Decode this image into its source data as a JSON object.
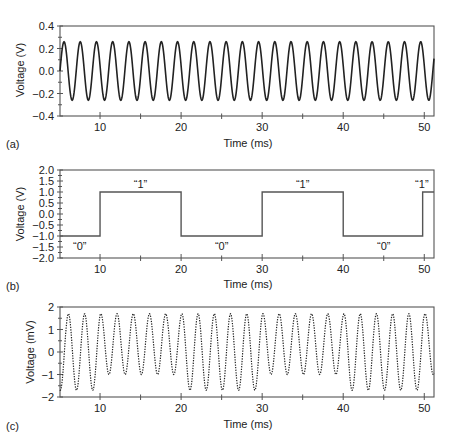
{
  "figure": {
    "panels": [
      {
        "label": "(a)",
        "ylabel": "Voltage (V)",
        "xlabel": "Time (ms)"
      },
      {
        "label": "(b)",
        "ylabel": "Voltage (V)",
        "xlabel": "Time (ms)"
      },
      {
        "label": "(c)",
        "ylabel": "Voltage (mV)",
        "xlabel": "Time (ms)"
      }
    ],
    "colors": {
      "line": "#222222",
      "axis": "#555555",
      "square": "#555555"
    }
  },
  "chart_data": [
    {
      "type": "line",
      "panel": "(a)",
      "title": "",
      "xlabel": "Time (ms)",
      "ylabel": "Voltage (V)",
      "xlim": [
        5.06,
        51.2
      ],
      "ylim": [
        -0.4,
        0.4
      ],
      "xticks": [
        10,
        20,
        30,
        40,
        50
      ],
      "yticks": [
        -0.4,
        -0.2,
        0.0,
        0.2,
        0.4
      ],
      "ytick_labels": [
        "−0.4",
        "−0.2",
        "0.0",
        "0.2",
        "0.4"
      ],
      "series": [
        {
          "name": "carrier",
          "function": "sine",
          "amplitude": 0.26,
          "period_ms": 2.0,
          "phase_ms": 5.06,
          "style": "solid"
        }
      ]
    },
    {
      "type": "line",
      "panel": "(b)",
      "title": "",
      "xlabel": "Time (ms)",
      "ylabel": "Voltage (V)",
      "xlim": [
        5.06,
        51.2
      ],
      "ylim": [
        -2.0,
        2.0
      ],
      "xticks": [
        10,
        20,
        30,
        40,
        50
      ],
      "yticks": [
        -2.0,
        -1.5,
        -1.0,
        -0.5,
        0.0,
        0.5,
        1.0,
        1.5,
        2.0
      ],
      "ytick_labels": [
        "−2.0",
        "−1.5",
        "−1.0",
        "−0.5",
        "0.0",
        "0.5",
        "1.0",
        "1.5",
        "2.0"
      ],
      "series": [
        {
          "name": "data",
          "style": "solid",
          "x": [
            5.06,
            10,
            10,
            20,
            20,
            30,
            30,
            40,
            40,
            49.8,
            49.8,
            51.2
          ],
          "y": [
            -1,
            -1,
            1,
            1,
            -1,
            -1,
            1,
            1,
            -1,
            -1,
            1,
            1
          ]
        }
      ],
      "annotations": [
        {
          "text": "“0”",
          "x": 7.5,
          "y": -1.45
        },
        {
          "text": "“1”",
          "x": 15,
          "y": 1.35
        },
        {
          "text": "“0”",
          "x": 25,
          "y": -1.45
        },
        {
          "text": "“1”",
          "x": 35,
          "y": 1.35
        },
        {
          "text": "“0”",
          "x": 45,
          "y": -1.45
        },
        {
          "text": "“1”",
          "x": 49.7,
          "y": 1.35
        }
      ]
    },
    {
      "type": "line",
      "panel": "(c)",
      "title": "",
      "xlabel": "Time (ms)",
      "ylabel": "Voltage (mV)",
      "xlim": [
        5.06,
        51.2
      ],
      "ylim": [
        -2,
        2
      ],
      "xticks": [
        10,
        20,
        30,
        40,
        50
      ],
      "yticks": [
        -2,
        -1,
        0,
        1,
        2
      ],
      "ytick_labels": [
        "−2",
        "−1",
        "0",
        "1",
        "2"
      ],
      "series": [
        {
          "name": "modulated",
          "style": "dotted",
          "period_ms": 2.0,
          "segments": [
            {
              "from": 5.06,
              "to": 10,
              "bit": 0,
              "amplitude": 1.7,
              "offset": 0.0
            },
            {
              "from": 10,
              "to": 20,
              "bit": 1,
              "amplitude": 1.35,
              "offset": 0.35
            },
            {
              "from": 20,
              "to": 30,
              "bit": 0,
              "amplitude": 1.7,
              "offset": 0.0
            },
            {
              "from": 30,
              "to": 40,
              "bit": 1,
              "amplitude": 1.35,
              "offset": 0.35
            },
            {
              "from": 40,
              "to": 49.8,
              "bit": 0,
              "amplitude": 1.7,
              "offset": 0.0
            },
            {
              "from": 49.8,
              "to": 51.2,
              "bit": 1,
              "amplitude": 1.35,
              "offset": 0.35
            }
          ]
        }
      ]
    }
  ]
}
